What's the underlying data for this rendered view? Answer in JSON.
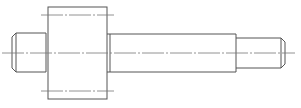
{
  "drawing": {
    "title": "Stepped shaft — technical drawing",
    "colors": {
      "background": "#ffffff",
      "outline": "#555555",
      "centerline": "#777777"
    },
    "parts": [
      {
        "name": "left-journal",
        "x": 12,
        "y": 33,
        "w": 34,
        "h": 39,
        "chamfer": 4
      },
      {
        "name": "flange",
        "x": 48,
        "y": 7,
        "w": 59,
        "h": 92
      },
      {
        "name": "shoulder",
        "x": 107,
        "y": 34,
        "w": 3,
        "h": 38
      },
      {
        "name": "main-shaft",
        "x": 110,
        "y": 34,
        "w": 126,
        "h": 38
      },
      {
        "name": "right-journal",
        "x": 236,
        "y": 38,
        "w": 49,
        "h": 30,
        "chamfer": 4
      }
    ],
    "centerlines": [
      {
        "name": "axis",
        "x1": 2,
        "y1": 53,
        "x2": 295,
        "y2": 53
      },
      {
        "name": "flange-top-bolt",
        "x1": 41,
        "y1": 15,
        "x2": 114,
        "y2": 15
      },
      {
        "name": "flange-bottom-bolt",
        "x1": 41,
        "y1": 91,
        "x2": 114,
        "y2": 91
      }
    ]
  }
}
